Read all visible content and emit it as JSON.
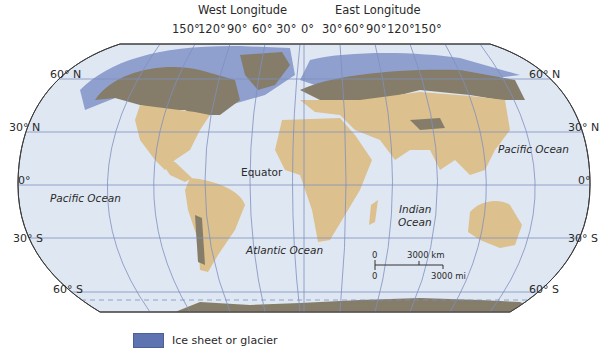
{
  "map": {
    "header": {
      "west_title": "West Longitude",
      "east_title": "East Longitude",
      "west_ticks": [
        "150°",
        "120°",
        "90°",
        "60°",
        "30°"
      ],
      "zero": "0°",
      "east_ticks": [
        "30°",
        "60°",
        "90°",
        "120°",
        "150°"
      ]
    },
    "latitudes_left": [
      "60° N",
      "30° N",
      "0°",
      "30° S",
      "60° S"
    ],
    "latitudes_right": [
      "60° N",
      "30° N",
      "0°",
      "30° S",
      "60° S"
    ],
    "labels": {
      "pacific_west": "Pacific Ocean",
      "pacific_east": "Pacific Ocean",
      "atlantic": "Atlantic Ocean",
      "indian_1": "Indian",
      "indian_2": "Ocean",
      "equator": "Equator"
    },
    "scale_bar": {
      "km_zero": "0",
      "km_label": "3000 km",
      "mi_zero": "0",
      "mi_label": "3000 mi"
    },
    "legend": {
      "label": "Ice sheet or glacier",
      "color": "#5d74b0"
    },
    "colors": {
      "ocean": "#dfe7f3",
      "land": "#dcc08e",
      "tundra_dark": "#857d6a",
      "ice": "#7d90c4",
      "grid": "#7f8fbf"
    }
  }
}
